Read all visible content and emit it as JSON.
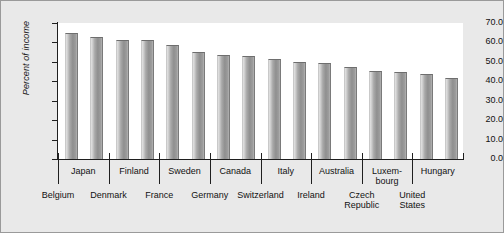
{
  "chart_data": {
    "type": "bar",
    "title": "",
    "xlabel": "",
    "ylabel": "Percent of income",
    "ylim": [
      0.0,
      70.0
    ],
    "ytick_labels": [
      "70.0",
      "60.0",
      "50.0",
      "40.0",
      "30.0",
      "20.0",
      "10.0",
      "0.0"
    ],
    "yticks": [
      70.0,
      60.0,
      50.0,
      40.0,
      30.0,
      20.0,
      10.0,
      0.0
    ],
    "grid": false,
    "legend": null,
    "categories": [
      "Belgium",
      "Japan",
      "Denmark",
      "Finland",
      "France",
      "Sweden",
      "Germany",
      "Canada",
      "Switzerland",
      "Italy",
      "Ireland",
      "Australia",
      "Czech Republic",
      "Luxembourg",
      "United States",
      "Hungary"
    ],
    "values": [
      64.5,
      62.5,
      61.0,
      60.5,
      58.0,
      54.5,
      53.0,
      52.5,
      51.0,
      49.5,
      49.0,
      47.0,
      45.0,
      44.5,
      43.5,
      41.0
    ],
    "x_tick_label_rows": [
      {
        "row": 1,
        "labels": [
          "Japan",
          "Finland",
          "Sweden",
          "Canada",
          "Italy",
          "Australia",
          "Luxem-\nbourg",
          "Hungary"
        ]
      },
      {
        "row": 2,
        "labels": [
          "Belgium",
          "Denmark",
          "France",
          "Germany",
          "Switzerland",
          "Ireland",
          "Czech\nRepublic",
          "United\nStates"
        ]
      }
    ]
  },
  "axis": {
    "y_title": "Percent of income",
    "y_tick_0": "70.0",
    "y_tick_1": "60.0",
    "y_tick_2": "50.0",
    "y_tick_3": "40.0",
    "y_tick_4": "30.0",
    "y_tick_5": "20.0",
    "y_tick_6": "10.0",
    "y_tick_7": "0.0"
  },
  "x_labels_row1": [
    "Japan",
    "Finland",
    "Sweden",
    "Canada",
    "Italy",
    "Australia",
    "Luxem-",
    "Hungary"
  ],
  "x_labels_row1_cont": [
    "bourg"
  ],
  "x_labels_row2": [
    "Belgium",
    "Denmark",
    "France",
    "Germany",
    "Switzerland",
    "Ireland",
    "Czech",
    "United"
  ],
  "x_labels_row2_cont": [
    "Republic",
    "States"
  ],
  "colors": {
    "figure_background": "#e9e9e9",
    "plot_background": "#ffffff",
    "axis": "#1f1f1f",
    "bar_light": "#e3e3e3",
    "bar_dark": "#8f8f8f",
    "text": "#111111"
  }
}
